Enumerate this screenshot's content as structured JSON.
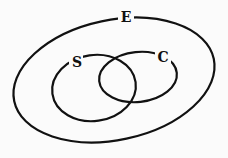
{
  "diagram": {
    "type": "venn",
    "sets": [
      {
        "id": "E",
        "label": "E",
        "contains": [
          "S",
          "C"
        ]
      },
      {
        "id": "S",
        "label": "S",
        "overlaps": [
          "C"
        ]
      },
      {
        "id": "C",
        "label": "C",
        "overlaps": [
          "S"
        ]
      }
    ]
  }
}
